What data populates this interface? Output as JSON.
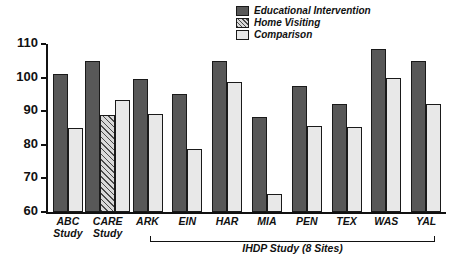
{
  "chart_data": {
    "type": "bar",
    "title": "",
    "xlabel": "",
    "ylabel": "",
    "ylim": [
      60,
      110
    ],
    "ytick_labels": [
      "110",
      "100",
      "90",
      "80",
      "70",
      "60"
    ],
    "yticks": [
      110,
      100,
      90,
      80,
      70,
      60
    ],
    "grid": false,
    "legend_position": "top-right",
    "categories": [
      "ABC\nStudy",
      "CARE\nStudy",
      "ARK",
      "EIN",
      "HAR",
      "MIA",
      "PEN",
      "TEX",
      "WAS",
      "YAL"
    ],
    "series": [
      {
        "name": "Educational Intervention",
        "color": "#585858",
        "fill": "solid",
        "values": [
          101.2,
          104.8,
          99.5,
          95.2,
          105.0,
          88.4,
          97.4,
          92.2,
          108.6,
          104.8
        ]
      },
      {
        "name": "Home Visiting",
        "color": "#d9d9d9",
        "fill": "hatched",
        "values": [
          null,
          88.8,
          null,
          null,
          null,
          null,
          null,
          null,
          null,
          null
        ]
      },
      {
        "name": "Comparison",
        "color": "#e8e8e8",
        "fill": "solid",
        "values": [
          84.9,
          93.3,
          89.2,
          78.9,
          98.7,
          65.5,
          85.7,
          85.3,
          99.8,
          92.2
        ]
      }
    ],
    "annotations": [
      {
        "text": "IHDP Study (8 Sites)",
        "type": "group-bracket",
        "spans": [
          "ARK",
          "EIN",
          "HAR",
          "MIA",
          "PEN",
          "TEX",
          "WAS",
          "YAL"
        ]
      }
    ]
  },
  "legend": {
    "items": [
      {
        "label": "Educational Intervention",
        "swatch": "dark-solid-swatch"
      },
      {
        "label": "Home Visiting",
        "swatch": "hatched-swatch"
      },
      {
        "label": "Comparison",
        "swatch": "light-solid-swatch"
      }
    ]
  },
  "axis": {
    "y_labels": [
      "110",
      "100",
      "90",
      "80",
      "70",
      "60"
    ]
  },
  "group_bracket": {
    "label": "IHDP Study (8 Sites)"
  }
}
